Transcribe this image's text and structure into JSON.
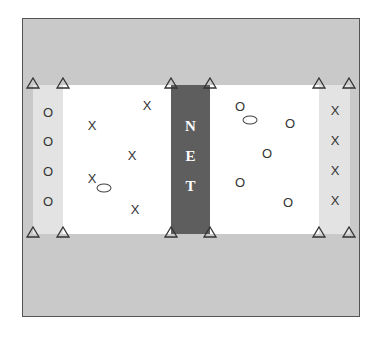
{
  "diagram": {
    "net": {
      "letters": [
        "N",
        "E",
        "T"
      ],
      "color": "#5e5e5e",
      "text_color": "#ffffff"
    },
    "colors": {
      "outer_area": "#c9c9c9",
      "side_zone": "#e3e3e3",
      "court": "#ffffff",
      "border": "#555555"
    },
    "cones": [
      {
        "x": 33,
        "y": 83
      },
      {
        "x": 63,
        "y": 83
      },
      {
        "x": 171,
        "y": 83
      },
      {
        "x": 210,
        "y": 83
      },
      {
        "x": 319,
        "y": 83
      },
      {
        "x": 349,
        "y": 83
      },
      {
        "x": 33,
        "y": 232
      },
      {
        "x": 63,
        "y": 232
      },
      {
        "x": 171,
        "y": 232
      },
      {
        "x": 210,
        "y": 232
      },
      {
        "x": 319,
        "y": 232
      },
      {
        "x": 349,
        "y": 232
      }
    ],
    "left_side_players": [
      {
        "symbol": "O",
        "x": 48,
        "y": 112
      },
      {
        "symbol": "O",
        "x": 48,
        "y": 141
      },
      {
        "symbol": "O",
        "x": 48,
        "y": 171
      },
      {
        "symbol": "O",
        "x": 48,
        "y": 201
      }
    ],
    "left_court_players": [
      {
        "symbol": "X",
        "x": 147,
        "y": 105
      },
      {
        "symbol": "X",
        "x": 92,
        "y": 125
      },
      {
        "symbol": "X",
        "x": 132,
        "y": 155
      },
      {
        "symbol": "X",
        "x": 92,
        "y": 178
      },
      {
        "symbol": "X",
        "x": 135,
        "y": 209
      }
    ],
    "right_court_players": [
      {
        "symbol": "O",
        "x": 240,
        "y": 106
      },
      {
        "symbol": "O",
        "x": 290,
        "y": 123
      },
      {
        "symbol": "O",
        "x": 267,
        "y": 153
      },
      {
        "symbol": "O",
        "x": 240,
        "y": 182
      },
      {
        "symbol": "O",
        "x": 288,
        "y": 202
      }
    ],
    "right_side_players": [
      {
        "symbol": "X",
        "x": 335,
        "y": 110
      },
      {
        "symbol": "X",
        "x": 335,
        "y": 140
      },
      {
        "symbol": "X",
        "x": 335,
        "y": 170
      },
      {
        "symbol": "X",
        "x": 335,
        "y": 200
      }
    ],
    "balls": [
      {
        "x": 104,
        "y": 188,
        "w": 15,
        "h": 9
      },
      {
        "x": 250,
        "y": 120,
        "w": 15,
        "h": 9
      }
    ]
  }
}
